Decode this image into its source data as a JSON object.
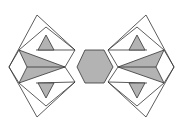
{
  "figure": {
    "colors": {
      "fill_shaded": "#b3b3b3",
      "stroke": "#333333",
      "background": "#ffffff",
      "fill_white": "#ffffff"
    },
    "elements": [
      "left-tiling",
      "center-hexagon",
      "right-tiling"
    ]
  }
}
